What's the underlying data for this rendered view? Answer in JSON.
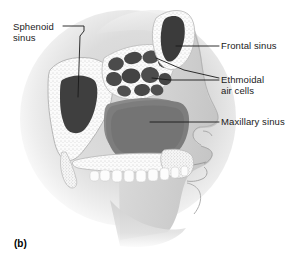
{
  "figure": {
    "caption": "(b)"
  },
  "labels": {
    "sphenoid": "Sphenoid\nsinus",
    "frontal": "Frontal sinus",
    "ethmoidal": "Ethmoidal\nair cells",
    "maxillary": "Maxillary sinus"
  },
  "colors": {
    "background": "#ffffff",
    "soft_tissue_light": "#e9e9e9",
    "soft_tissue_mid": "#d6d6d6",
    "soft_tissue_dark": "#c2c2c2",
    "bone_white": "#fbfbfb",
    "bone_stipple": "#9a9a9a",
    "sinus_dark": "#4a4a4a",
    "sinus_darkest": "#3a3a3a",
    "cavity_gray": "#8e8e8e",
    "leader_line": "#1a1a1a",
    "text": "#1a1a1a",
    "tooth": "#fdfdfd"
  },
  "structures": [
    {
      "name": "sphenoid-sinus",
      "description": "dark irregular cavity in sphenoid bone, posterior"
    },
    {
      "name": "frontal-sinus",
      "description": "elongated dark cavity in frontal bone, superior anterior"
    },
    {
      "name": "ethmoidal-air-cells",
      "description": "honeycomb cluster of small dark cells between orbits"
    },
    {
      "name": "maxillary-sinus",
      "description": "large gray cavity above hard palate"
    },
    {
      "name": "nasal-cavity",
      "description": "air passage with turbinates"
    },
    {
      "name": "hard-palate",
      "description": "stippled bone plate above teeth"
    },
    {
      "name": "teeth",
      "description": "row of white upper teeth"
    },
    {
      "name": "facial-profile",
      "description": "nose, lips, chin in lateral view"
    }
  ]
}
